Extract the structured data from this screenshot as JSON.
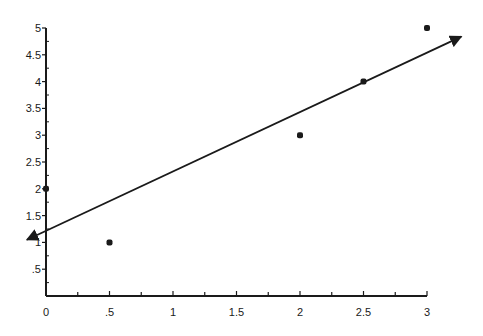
{
  "chart_data": {
    "type": "scatter",
    "title": "",
    "xlabel": "",
    "ylabel": "",
    "xlim": [
      0,
      3
    ],
    "ylim": [
      0,
      5
    ],
    "grid": false,
    "legend": null,
    "x_ticks": [
      {
        "value": 0,
        "label": "0"
      },
      {
        "value": 0.5,
        "label": ".5"
      },
      {
        "value": 1,
        "label": "1"
      },
      {
        "value": 1.5,
        "label": "1.5"
      },
      {
        "value": 2,
        "label": "2"
      },
      {
        "value": 2.5,
        "label": "2.5"
      },
      {
        "value": 3,
        "label": "3"
      }
    ],
    "x_minor_ticks": [
      0.25,
      0.75,
      1.25,
      1.75,
      2.25,
      2.75
    ],
    "y_ticks": [
      {
        "value": 0.5,
        "label": ".5"
      },
      {
        "value": 1,
        "label": "1"
      },
      {
        "value": 1.5,
        "label": "1.5"
      },
      {
        "value": 2,
        "label": "2"
      },
      {
        "value": 2.5,
        "label": "2.5"
      },
      {
        "value": 3,
        "label": "3"
      },
      {
        "value": 3.5,
        "label": "3.5"
      },
      {
        "value": 4,
        "label": "4"
      },
      {
        "value": 4.5,
        "label": "4.5"
      },
      {
        "value": 5,
        "label": "5"
      }
    ],
    "y_minor_ticks": [
      0.25,
      0.75,
      1.25,
      1.75,
      2.25,
      2.75,
      3.25,
      3.75,
      4.25,
      4.75
    ],
    "series": [
      {
        "name": "data points",
        "type": "scatter",
        "points": [
          {
            "x": 0,
            "y": 2
          },
          {
            "x": 0.5,
            "y": 1
          },
          {
            "x": 2,
            "y": 3
          },
          {
            "x": 2.5,
            "y": 4
          },
          {
            "x": 3,
            "y": 5
          }
        ]
      },
      {
        "name": "fitted line",
        "type": "line",
        "arrows": "both",
        "start": {
          "x": -0.15,
          "y": 1.05
        },
        "end": {
          "x": 3.27,
          "y": 4.84
        }
      }
    ]
  },
  "style": {
    "axis_color": "#1a1a1a",
    "point_color": "#1a1a1a",
    "line_color": "#1a1a1a"
  }
}
